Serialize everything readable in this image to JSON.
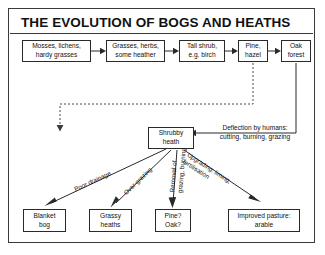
{
  "diagram": {
    "title": "THE EVOLUTION OF BOGS AND HEATHS",
    "succession": [
      {
        "id": "mosses",
        "lines": [
          "Mosses, lichens,",
          "hardy grasses"
        ]
      },
      {
        "id": "grasses",
        "lines": [
          "Grasses, herbs,",
          "some heather"
        ]
      },
      {
        "id": "shrub",
        "lines": [
          "Tall shrub,",
          "e.g. birch"
        ]
      },
      {
        "id": "pine",
        "lines": [
          "Pine,",
          "hazel"
        ]
      },
      {
        "id": "oak",
        "lines": [
          "Oak",
          "forest"
        ]
      }
    ],
    "hub": {
      "id": "shrubby-heath",
      "lines": [
        "Shrubby",
        "heath"
      ]
    },
    "deflection_note": {
      "lines": [
        "Deflection by humans:",
        "cutting, burning, grazing"
      ]
    },
    "pathways": [
      {
        "id": "poor-drainage",
        "lines": [
          "Poor drainage"
        ]
      },
      {
        "id": "over-grazing",
        "lines": [
          "Over-grazing"
        ]
      },
      {
        "id": "removal",
        "lines": [
          "Removal of",
          "grazing, burning"
        ]
      },
      {
        "id": "upgrading",
        "lines": [
          "Upgrading: liming,",
          "fertilisation"
        ]
      }
    ],
    "outcomes": [
      {
        "id": "blanket-bog",
        "lines": [
          "Blanket",
          "bog"
        ]
      },
      {
        "id": "grassy-heaths",
        "lines": [
          "Grassy",
          "heaths"
        ]
      },
      {
        "id": "pine-oak",
        "lines": [
          "Pine?",
          "Oak?"
        ]
      },
      {
        "id": "improved-pasture",
        "lines": [
          "Improved pasture:",
          "arable"
        ]
      }
    ],
    "colors": {
      "ink": "#111111",
      "line": "#2a2a2a",
      "paper": "#ffffff"
    }
  }
}
